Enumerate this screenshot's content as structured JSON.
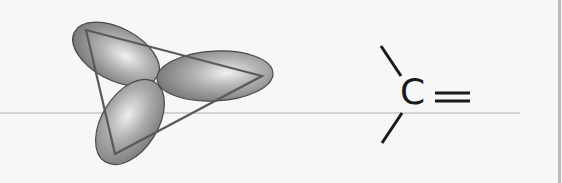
{
  "diagram": {
    "orbital_model": {
      "lobes": 3,
      "lobe_color": "#8c8c8c",
      "highlight_color": "#f0f0f0",
      "outline_color": "#4a4a4a",
      "triangle_color": "#5a5a5a"
    },
    "structural_formula": {
      "atom_label": "C",
      "double_bond_symbol": "=",
      "single_bonds": 2,
      "line_color": "#1a1a1a"
    },
    "background_color": "#f7f7f7",
    "guide_line_color": "#d4d4d4",
    "border_color": "#b9b9b9"
  }
}
